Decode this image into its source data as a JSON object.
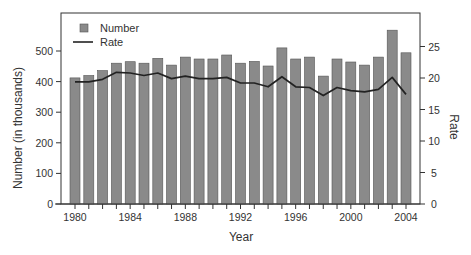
{
  "chart_data": {
    "type": "bar+line",
    "title": "",
    "xlabel": "Year",
    "ylabel": "Number (in thousands)",
    "y2label": "Rate",
    "categories": [
      1980,
      1981,
      1982,
      1983,
      1984,
      1985,
      1986,
      1987,
      1988,
      1989,
      1990,
      1991,
      1992,
      1993,
      1994,
      1995,
      1996,
      1997,
      1998,
      1999,
      2000,
      2001,
      2002,
      2003,
      2004
    ],
    "x_tick_labels": [
      "1980",
      "1984",
      "1988",
      "1992",
      "1996",
      "2000",
      "2004"
    ],
    "ylim": [
      0,
      560
    ],
    "y_ticks": [
      0,
      100,
      200,
      300,
      400,
      500
    ],
    "y2lim": [
      0,
      28
    ],
    "y2_ticks": [
      0,
      5,
      10,
      15,
      20,
      25
    ],
    "grid": false,
    "legend_position": "upper-left",
    "series": [
      {
        "name": "Number",
        "type": "bar",
        "axis": "left",
        "color": "#8a8a8a",
        "values": [
          412,
          420,
          436,
          460,
          465,
          460,
          476,
          454,
          480,
          474,
          474,
          487,
          460,
          466,
          451,
          510,
          474,
          480,
          418,
          474,
          464,
          454,
          480,
          568,
          494
        ]
      },
      {
        "name": "Rate",
        "type": "line",
        "axis": "right",
        "color": "#222222",
        "values": [
          19.4,
          19.4,
          19.8,
          20.9,
          20.8,
          20.4,
          20.8,
          19.9,
          20.3,
          19.9,
          19.9,
          20.1,
          19.2,
          19.2,
          18.6,
          20.2,
          18.6,
          18.5,
          17.2,
          18.5,
          18.0,
          17.8,
          18.2,
          20.1,
          17.4
        ]
      }
    ]
  },
  "legend": {
    "items": [
      {
        "label": "Number",
        "kind": "square"
      },
      {
        "label": "Rate",
        "kind": "line"
      }
    ]
  }
}
